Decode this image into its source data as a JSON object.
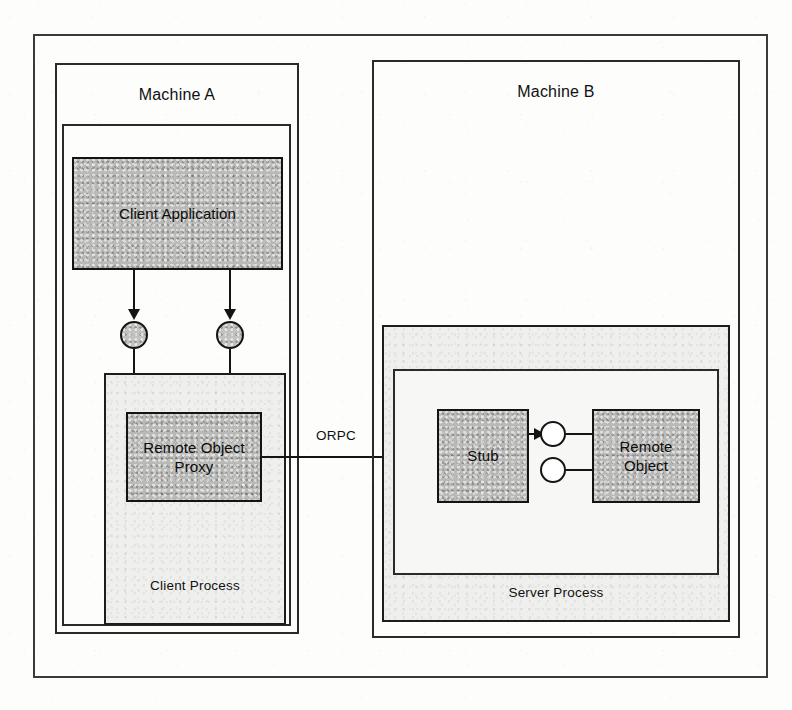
{
  "diagram": {
    "machines": [
      {
        "id": "machine-a",
        "label": "Machine A"
      },
      {
        "id": "machine-b",
        "label": "Machine B"
      }
    ],
    "processes": [
      {
        "id": "client-process",
        "label": "Client Process"
      },
      {
        "id": "server-process",
        "label": "Server Process"
      }
    ],
    "components": [
      {
        "id": "client-application",
        "label": "Client Application"
      },
      {
        "id": "remote-object-proxy",
        "label": "Remote Object\nProxy",
        "line1": "Remote Object",
        "line2": "Proxy"
      },
      {
        "id": "stub",
        "label": "Stub"
      },
      {
        "id": "remote-object",
        "label": "Remote Object",
        "line1": "Remote",
        "line2": "Object"
      }
    ],
    "connectors": [
      {
        "id": "orpc-link",
        "label": "ORPC",
        "from": "remote-object-proxy",
        "to": "stub",
        "style": "arrow-right"
      },
      {
        "id": "client-interface-left",
        "label": "",
        "from": "client-application",
        "to": "remote-object-proxy",
        "style": "arrow-down-lollipop"
      },
      {
        "id": "client-interface-right",
        "label": "",
        "from": "client-application",
        "to": "remote-object-proxy",
        "style": "arrow-down-lollipop"
      },
      {
        "id": "stub-to-object",
        "label": "",
        "from": "stub",
        "to": "remote-object",
        "style": "arrow-right-lollipop"
      },
      {
        "id": "object-second-interface",
        "label": "",
        "from": "remote-object",
        "to": "remote-object",
        "style": "lollipop"
      }
    ],
    "interfaces": [
      {
        "id": "client-lollipop-1",
        "fill": "shaded"
      },
      {
        "id": "client-lollipop-2",
        "fill": "shaded"
      },
      {
        "id": "server-lollipop-1",
        "fill": "hollow"
      },
      {
        "id": "server-lollipop-2",
        "fill": "hollow"
      }
    ],
    "colors": {
      "ink": "#141414",
      "shaded_fill": "#b9b9b7",
      "tint_fill": "#efefed",
      "paper": "#fdfdfc"
    }
  }
}
